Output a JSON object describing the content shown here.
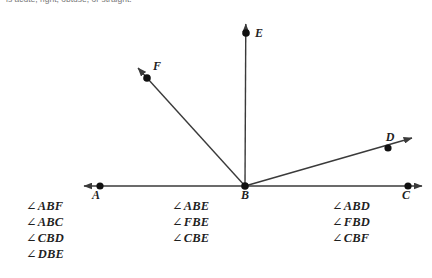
{
  "instruction": {
    "text": "is acute, right, obtuse, or straight."
  },
  "figure": {
    "stroke_color": "#3a3a3a",
    "point_color": "#111111",
    "points": {
      "A": {
        "label": "A",
        "x": 100,
        "y": 186
      },
      "B": {
        "label": "B",
        "x": 245,
        "y": 186
      },
      "C": {
        "label": "C",
        "x": 408,
        "y": 186
      },
      "D": {
        "label": "D",
        "x": 388,
        "y": 148
      },
      "E": {
        "label": "E",
        "x": 246,
        "y": 33
      },
      "F": {
        "label": "F",
        "x": 147,
        "y": 78
      }
    },
    "lines": [
      {
        "name": "line-AC",
        "x1": 78,
        "y1": 186,
        "x2": 428,
        "y2": 186,
        "arrow_start": true,
        "arrow_end": true
      },
      {
        "name": "ray-BE",
        "x1": 245,
        "y1": 186,
        "x2": 246,
        "y2": 20,
        "arrow_start": false,
        "arrow_end": true
      },
      {
        "name": "ray-BF",
        "x1": 245,
        "y1": 186,
        "x2": 134,
        "y2": 64,
        "arrow_start": false,
        "arrow_end": true
      },
      {
        "name": "ray-BD",
        "x1": 245,
        "y1": 186,
        "x2": 416,
        "y2": 137,
        "arrow_start": false,
        "arrow_end": true
      }
    ]
  },
  "angle_list": {
    "symbol": "∠",
    "columns": [
      {
        "name": "column-1",
        "items": [
          "ABF",
          "ABC",
          "CBD",
          "DBE"
        ]
      },
      {
        "name": "column-2",
        "items": [
          "ABE",
          "FBE",
          "CBE"
        ]
      },
      {
        "name": "column-3",
        "items": [
          "ABD",
          "FBD",
          "CBF"
        ]
      }
    ]
  }
}
